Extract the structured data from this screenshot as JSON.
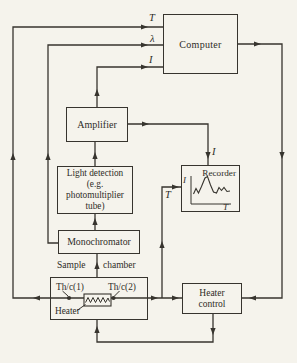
{
  "boxes": {
    "computer": "Computer",
    "amplifier": "Amplifier",
    "light_detection": "Light detection\n(e.g.\nphotomultiplier\ntube)",
    "monochromator": "Monochromator",
    "recorder": "Recorder",
    "heater_control": "Heater\ncontrol"
  },
  "signals": {
    "temperature_to_computer": "T",
    "wavelength_to_computer": "λ",
    "intensity_to_computer": "I",
    "intensity_to_recorder": "I",
    "temperature_to_recorder": "T"
  },
  "recorder_graph": {
    "y_axis_label": "I",
    "x_axis_label": "T"
  },
  "sample_chamber": {
    "title_word_1": "Sample",
    "title_word_2": "chamber",
    "thermocouple_1": "Th/c(1)",
    "thermocouple_2": "Th/c(2)",
    "heater_label": "Heater"
  },
  "colors": {
    "ink": "#37342e",
    "paper": "#f5f3ec"
  }
}
